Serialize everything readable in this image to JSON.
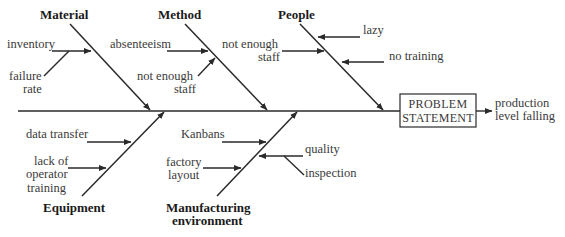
{
  "diagram": {
    "type": "fishbone",
    "problem_statement": [
      "PROBLEM",
      "STATEMENT"
    ],
    "effect": [
      "production",
      "level falling"
    ],
    "categories": {
      "material": {
        "label": "Material",
        "causes": {
          "inventory": [
            "inventory"
          ],
          "failure_rate": [
            "failure",
            "rate"
          ]
        }
      },
      "method": {
        "label": "Method",
        "causes": {
          "absenteeism": [
            "absenteeism"
          ],
          "not_enough_staff": [
            "not enough",
            "staff"
          ]
        }
      },
      "people": {
        "label": "People",
        "causes": {
          "lazy": [
            "lazy"
          ],
          "no_training": [
            "no training"
          ],
          "not_enough_staff": [
            "not enough",
            "staff"
          ]
        }
      },
      "equipment": {
        "label": "Equipment",
        "causes": {
          "data_transfer": [
            "data transfer"
          ],
          "lack_of_operator_training": [
            "lack of",
            "operator",
            "training"
          ]
        }
      },
      "manufacturing": {
        "label": [
          "Manufacturing",
          "environment"
        ],
        "causes": {
          "kanbans": [
            "Kanbans"
          ],
          "factory_layout": [
            "factory",
            "layout"
          ],
          "quality": [
            "quality"
          ],
          "inspection": [
            "inspection"
          ]
        }
      }
    }
  }
}
